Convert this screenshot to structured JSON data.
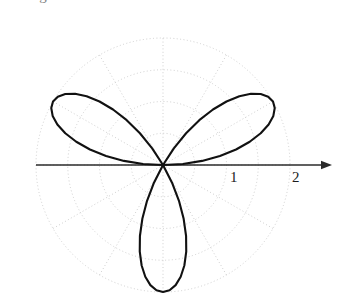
{
  "figure": {
    "background_color": "#ffffff",
    "curve_color": "#111111",
    "grid_color": "#c9c9c9",
    "axis_color": "#2b2b2b",
    "top_clipped_fragment": "o  g   2   o",
    "center": {
      "x": 163,
      "y": 165
    },
    "pixels_per_unit": 63.5,
    "axis_arrow": {
      "name": "polar-axis-arrow",
      "from_x": 36,
      "to_x": 332,
      "y": 165
    },
    "tick_labels": [
      {
        "text": "1",
        "x": 230,
        "y": 170
      },
      {
        "text": "2",
        "x": 292,
        "y": 170
      }
    ]
  },
  "chart_data": {
    "type": "line",
    "subtype": "polar-rose",
    "title": "",
    "xlabel": "",
    "ylabel": "",
    "equation": "r = 2 sin(3θ)",
    "petal_count": 3,
    "max_radius": 2,
    "petal_angles_deg": [
      30,
      150,
      270
    ],
    "radial_ticks": [
      1,
      2
    ],
    "radial_tick_labels": [
      "1",
      "2"
    ],
    "rlim": [
      0,
      2
    ],
    "theta_range_deg": [
      0,
      360
    ],
    "angular_grid_step_deg": 30,
    "radial_grid_circles": [
      0.5,
      1.0,
      1.5,
      2.0
    ],
    "grid": true,
    "legend": false,
    "legend_position": "none",
    "series": [
      {
        "name": "r = 2 sin(3θ)",
        "color": "#111111",
        "points_theta_deg": [
          0,
          3,
          6,
          9,
          12,
          15,
          18,
          21,
          24,
          27,
          30,
          33,
          36,
          39,
          42,
          45,
          48,
          51,
          54,
          57,
          60,
          63,
          66,
          69,
          72,
          75,
          78,
          81,
          84,
          87,
          90,
          93,
          96,
          99,
          102,
          105,
          108,
          111,
          114,
          117,
          120,
          123,
          126,
          129,
          132,
          135,
          138,
          141,
          144,
          147,
          150,
          153,
          156,
          159,
          162,
          165,
          168,
          171,
          174,
          177,
          180,
          183,
          186,
          189,
          192,
          195,
          198,
          201,
          204,
          207,
          210,
          213,
          216,
          219,
          222,
          225,
          228,
          231,
          234,
          237,
          240,
          243,
          246,
          249,
          252,
          255,
          258,
          261,
          264,
          267,
          270,
          273,
          276,
          279,
          282,
          285,
          288,
          291,
          294,
          297,
          300,
          303,
          306,
          309,
          312,
          315,
          318,
          321,
          324,
          327,
          330,
          333,
          336,
          339,
          342,
          345,
          348,
          351,
          354,
          357,
          360
        ],
        "points_r": [
          0,
          0.313,
          0.618,
          0.908,
          1.176,
          1.414,
          1.618,
          1.782,
          1.902,
          1.975,
          2,
          1.975,
          1.902,
          1.782,
          1.618,
          1.414,
          1.176,
          0.908,
          0.618,
          0.313,
          0,
          0,
          0,
          0,
          0,
          0,
          0,
          0,
          0,
          0,
          0,
          0,
          0,
          0,
          0,
          0,
          0,
          0,
          0,
          0,
          0,
          0.313,
          0.618,
          0.908,
          1.176,
          1.414,
          1.618,
          1.782,
          1.902,
          1.975,
          2,
          1.975,
          1.902,
          1.782,
          1.618,
          1.414,
          1.176,
          0.908,
          0.618,
          0.313,
          0,
          0,
          0,
          0,
          0,
          0,
          0,
          0,
          0,
          0,
          0,
          0,
          0,
          0,
          0,
          0,
          0,
          0,
          0,
          0,
          0,
          0.313,
          0.618,
          0.908,
          1.176,
          1.414,
          1.618,
          1.782,
          1.902,
          1.975,
          2,
          1.975,
          1.902,
          1.782,
          1.618,
          1.414,
          1.176,
          0.908,
          0.618,
          0.313,
          0,
          0,
          0,
          0,
          0,
          0,
          0,
          0,
          0,
          0,
          0,
          0,
          0,
          0,
          0,
          0,
          0,
          0,
          0,
          0,
          0,
          0
        ]
      }
    ]
  }
}
